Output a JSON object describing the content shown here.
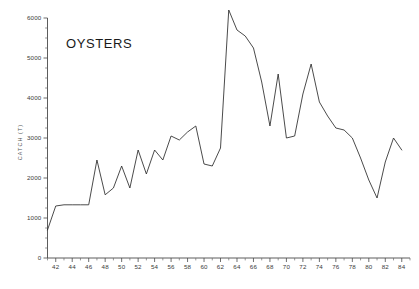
{
  "chart_data": {
    "type": "line",
    "title": "OYSTERS",
    "xlabel": "",
    "ylabel": "CATCH (T)",
    "xlim": [
      41,
      85
    ],
    "ylim": [
      0,
      6000
    ],
    "grid": false,
    "legend": null,
    "ytick_labels": [
      "0",
      "1000",
      "2000",
      "3000",
      "4000",
      "5000",
      "6000"
    ],
    "ytick_values": [
      0,
      1000,
      2000,
      3000,
      4000,
      5000,
      6000
    ],
    "ytick_minor_step": 250,
    "xtick_labels": [
      "42",
      "44",
      "46",
      "48",
      "50",
      "52",
      "54",
      "56",
      "58",
      "60",
      "62",
      "64",
      "66",
      "68",
      "70",
      "72",
      "74",
      "76",
      "78",
      "80",
      "82",
      "84"
    ],
    "xtick_values": [
      42,
      44,
      46,
      48,
      50,
      52,
      54,
      56,
      58,
      60,
      62,
      64,
      66,
      68,
      70,
      72,
      74,
      76,
      78,
      80,
      82,
      84
    ],
    "xtick_minor_step": 1,
    "series": [
      {
        "name": "Oyster catch",
        "color": "#2b2b2b",
        "x": [
          41,
          42,
          43,
          44,
          45,
          46,
          47,
          48,
          49,
          50,
          51,
          52,
          53,
          54,
          55,
          56,
          57,
          58,
          59,
          60,
          61,
          62,
          63,
          64,
          65,
          66,
          67,
          68,
          69,
          70,
          71,
          72,
          73,
          74,
          75,
          76,
          77,
          78,
          79,
          80,
          81,
          82,
          83,
          84
        ],
        "values": [
          700,
          1300,
          1330,
          1330,
          1330,
          1330,
          2450,
          1580,
          1750,
          2300,
          1750,
          2700,
          2100,
          2700,
          2450,
          3050,
          2950,
          3150,
          3300,
          2350,
          2300,
          2750,
          6200,
          5700,
          5550,
          5250,
          4400,
          3300,
          4600,
          3000,
          3050,
          4100,
          4850,
          3900,
          3550,
          3250,
          3200,
          3000,
          2500,
          1950,
          1500,
          2400,
          3000,
          2700
        ]
      }
    ]
  }
}
